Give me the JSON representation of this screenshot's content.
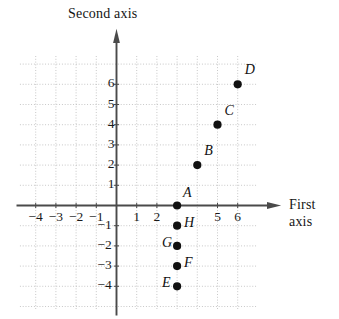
{
  "figure": {
    "second_axis_label": "Second axis",
    "first_axis_label_line1": "First",
    "first_axis_label_line2": "axis"
  },
  "chart_data": {
    "type": "scatter",
    "title": "",
    "xlabel": "First axis",
    "ylabel": "Second axis",
    "xlim": [
      -5,
      7
    ],
    "ylim": [
      -5,
      7
    ],
    "grid": true,
    "grid_step": 1,
    "legend": false,
    "x_tick_labels": [
      "−4",
      "−3",
      "−2",
      "−1",
      "1",
      "2",
      "5",
      "6"
    ],
    "x_tick_values": [
      -4,
      -3,
      -2,
      -1,
      1,
      2,
      5,
      6
    ],
    "y_tick_labels": [
      "6",
      "5",
      "4",
      "3",
      "2",
      "1",
      "−1",
      "−2",
      "−3",
      "−4"
    ],
    "y_tick_values": [
      6,
      5,
      4,
      3,
      2,
      1,
      -1,
      -2,
      -3,
      -4
    ],
    "points": [
      {
        "label": "A",
        "x": 3,
        "y": 0,
        "label_dx": 6,
        "label_dy": -14
      },
      {
        "label": "B",
        "x": 4,
        "y": 2,
        "label_dx": 7,
        "label_dy": -15
      },
      {
        "label": "C",
        "x": 5,
        "y": 4,
        "label_dx": 7,
        "label_dy": -15
      },
      {
        "label": "D",
        "x": 6,
        "y": 6,
        "label_dx": 7,
        "label_dy": -15
      },
      {
        "label": "E",
        "x": 3,
        "y": -4,
        "label_dx": -15,
        "label_dy": -4
      },
      {
        "label": "F",
        "x": 3,
        "y": -3,
        "label_dx": 7,
        "label_dy": -4
      },
      {
        "label": "G",
        "x": 3,
        "y": -2,
        "label_dx": -15,
        "label_dy": -4
      },
      {
        "label": "H",
        "x": 3,
        "y": -1,
        "label_dx": 7,
        "label_dy": -4
      }
    ]
  },
  "colors": {
    "axis": "#4a4a4a",
    "grid": "#b9b9b9",
    "point": "#111111",
    "text": "#1a1a1a",
    "background": "#ffffff"
  }
}
